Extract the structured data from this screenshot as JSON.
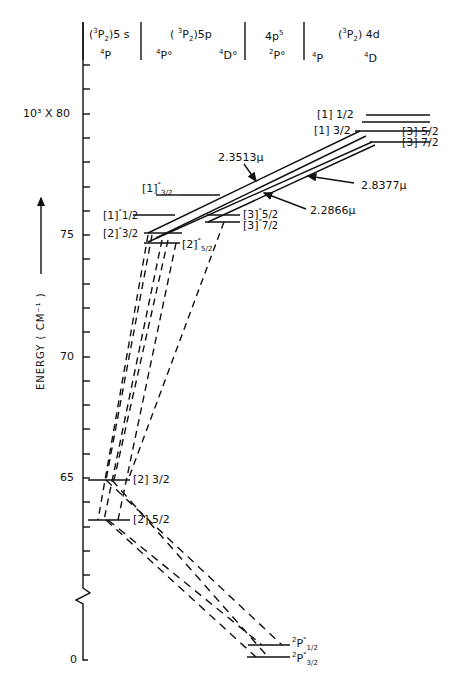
{
  "diagram": {
    "type": "energy-level-diagram",
    "ylabel": "ENERGY (CM⁻¹)",
    "yaxis_prefix": "10³ X",
    "yticks": [
      {
        "value": "80",
        "label": "10³ X 80"
      },
      {
        "value": "75",
        "label": "75"
      },
      {
        "value": "70",
        "label": "70"
      },
      {
        "value": "65",
        "label": "65"
      },
      {
        "value": "0",
        "label": "0"
      }
    ],
    "axis_break": true,
    "columns": [
      {
        "config": "(³P₂)5s",
        "terms": [
          "⁴P"
        ]
      },
      {
        "config": "(³P₂)5p",
        "terms": [
          "⁴P°",
          "⁴D°"
        ]
      },
      {
        "config": "4p⁵",
        "terms": [
          "²P°"
        ]
      },
      {
        "config": "(³P₂)4d",
        "terms": [
          "⁴P",
          "⁴D"
        ]
      }
    ],
    "levels": [
      {
        "label": "[1] 1/2",
        "group": "4d"
      },
      {
        "label": "[1] 3/2",
        "group": "4d"
      },
      {
        "label": "[3] 5/2",
        "group": "4d"
      },
      {
        "label": "[3] 7/2",
        "group": "4d"
      },
      {
        "label": "[1]° 3/2",
        "group": "5p"
      },
      {
        "label": "[1]° 1/2",
        "group": "5p"
      },
      {
        "label": "[2]° 3/2",
        "group": "5p"
      },
      {
        "label": "[2]° 5/2",
        "group": "5p"
      },
      {
        "label": "[3]° 5/2",
        "group": "5p"
      },
      {
        "label": "[3]° 7/2",
        "group": "5p"
      },
      {
        "label": "[2] 3/2",
        "group": "5s"
      },
      {
        "label": "[2] 5/2",
        "group": "5s"
      },
      {
        "label": "²P° 1/2",
        "group": "4p5"
      },
      {
        "label": "²P° 3/2",
        "group": "4p5"
      }
    ],
    "transitions": [
      {
        "wavelength": "2.3513μ"
      },
      {
        "wavelength": "2.8377μ"
      },
      {
        "wavelength": "2.2866μ"
      }
    ]
  },
  "text": {
    "hdr_5s_config": "(",
    "hdr_5s_sup": "3",
    "hdr_5s_p": "P",
    "hdr_5s_sub": "2",
    "hdr_5s_tail": ")5 s",
    "hdr_5s_term_sup": "4",
    "hdr_5s_term": "P",
    "hdr_5p_config_a": "( ",
    "hdr_5p_sup": "3",
    "hdr_5p_p": "P",
    "hdr_5p_sub": "2",
    "hdr_5p_tail": ")5p",
    "hdr_5p_t1_sup": "4",
    "hdr_5p_t1": "P°",
    "hdr_5p_t2_sup": "4",
    "hdr_5p_t2": "D°",
    "hdr_4p5_base": "4p",
    "hdr_4p5_sup": "5",
    "hdr_4p5_t_sup": "2",
    "hdr_4p5_t": "P°",
    "hdr_4d_a": "(",
    "hdr_4d_sup": "3",
    "hdr_4d_p": "P",
    "hdr_4d_sub": "2",
    "hdr_4d_tail": ") 4d",
    "hdr_4d_t1_sup": "4",
    "hdr_4d_t1": "P",
    "hdr_4d_t2_sup": "4",
    "hdr_4d_t2": "D",
    "tick_80": "10³ X 80",
    "tick_75": "75",
    "tick_70": "70",
    "tick_65": "65",
    "tick_0": "0",
    "ylabel": "ENERGY  ( CM⁻¹ )",
    "lv_4d_1_12": "[1]  1/2",
    "lv_4d_1_32": "[1]  3/2",
    "lv_4d_3_52": "[3]  5/2",
    "lv_4d_3_72": "[3]  7/2",
    "lv_5p_1_32_b": "[1]",
    "lv_5p_1_32_s": "°",
    "lv_5p_1_32_f": "3/2",
    "lv_5p_1_12_b": "[1]",
    "lv_5p_1_12_s": "°",
    "lv_5p_1_12_f": "1/2",
    "lv_5p_2_32_b": "[2]",
    "lv_5p_2_32_s": "°",
    "lv_5p_2_32_f": "3/2",
    "lv_5p_2_52_b": "[2]",
    "lv_5p_2_52_s": "°",
    "lv_5p_2_52_f": "5/2",
    "lv_5p_3_52_b": "[3]",
    "lv_5p_3_52_s": "°",
    "lv_5p_3_52_f": "5/2",
    "lv_5p_3_72_b": "[3]",
    "lv_5p_3_72_s": "°",
    "lv_5p_3_72_f": "7/2",
    "lv_5s_2_32": "[2]  3/2",
    "lv_5s_2_52": "[2]  5/2",
    "lv_g_12_sup": "2",
    "lv_g_12_p": "P",
    "lv_g_12_o": "°",
    "lv_g_12_f": "1/2",
    "lv_g_32_sup": "2",
    "lv_g_32_p": "P",
    "lv_g_32_o": "°",
    "lv_g_32_f": "3/2",
    "wl_1": "2.3513μ",
    "wl_2": "2.8377μ",
    "wl_3": "2.2866μ"
  }
}
